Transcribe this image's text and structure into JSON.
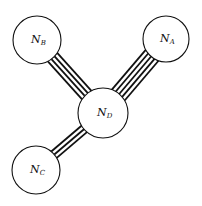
{
  "diagram": {
    "type": "network-graph",
    "nodes": [
      {
        "id": "A",
        "label": "N",
        "subscript": "A",
        "cx": 166,
        "cy": 39,
        "r": 23
      },
      {
        "id": "B",
        "label": "N",
        "subscript": "B",
        "cx": 37,
        "cy": 40,
        "r": 24
      },
      {
        "id": "C",
        "label": "N",
        "subscript": "C",
        "cx": 36,
        "cy": 170,
        "r": 24
      },
      {
        "id": "D",
        "label": "N",
        "subscript": "D",
        "cx": 103,
        "cy": 113,
        "r": 25
      }
    ],
    "edges": [
      {
        "from": "B",
        "to": "D",
        "lines": 4
      },
      {
        "from": "A",
        "to": "D",
        "lines": 5
      },
      {
        "from": "C",
        "to": "D",
        "lines": 3
      }
    ]
  }
}
